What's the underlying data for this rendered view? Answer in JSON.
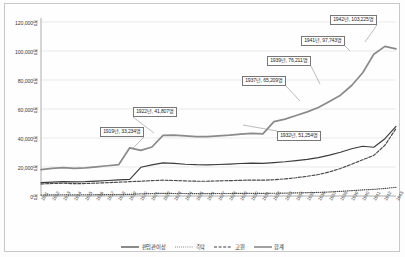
{
  "chart_data": {
    "type": "line",
    "title": "",
    "xlabel": "",
    "ylabel": "",
    "ylim": [
      0,
      120000
    ],
    "grid": true,
    "legend_position": "bottom",
    "y_ticks": [
      0,
      20000,
      40000,
      60000,
      80000,
      100000,
      120000
    ],
    "y_tick_labels": [
      "0명",
      "20,000명",
      "40,000명",
      "60,000명",
      "80,000명",
      "100,000명",
      "120,000명"
    ],
    "categories": [
      "1911",
      "1912",
      "1913",
      "1914",
      "1915",
      "1916",
      "1917",
      "1918",
      "1919",
      "1920",
      "1921",
      "1922",
      "1923",
      "1924",
      "1925",
      "1926",
      "1927",
      "1928",
      "1929",
      "1930",
      "1931",
      "1932",
      "1933",
      "1934",
      "1935",
      "1936",
      "1937",
      "1938",
      "1939",
      "1940",
      "1941",
      "1942",
      "1943"
    ],
    "series": [
      {
        "name": "판임관이상",
        "style": "solid-thin",
        "color": "#3c3c3c",
        "values": [
          9200,
          9600,
          9900,
          9700,
          9900,
          10300,
          10700,
          11100,
          11500,
          19800,
          21500,
          22800,
          22500,
          21900,
          21600,
          21500,
          21700,
          22000,
          22400,
          22700,
          22500,
          23000,
          23600,
          24400,
          25300,
          26500,
          28200,
          30200,
          32600,
          34300,
          33600,
          39500,
          48000
        ]
      },
      {
        "name": "촉탁",
        "style": "dotted",
        "color": "#4a4a4a",
        "values": [
          700,
          800,
          850,
          800,
          850,
          900,
          950,
          1000,
          1100,
          1500,
          1700,
          1800,
          1750,
          1700,
          1650,
          1650,
          1700,
          1750,
          1800,
          1850,
          1800,
          1900,
          2000,
          2150,
          2300,
          2500,
          2800,
          3200,
          3700,
          4200,
          4600,
          5200,
          6000
        ]
      },
      {
        "name": "고원",
        "style": "dashed",
        "color": "#4a4a4a",
        "values": [
          8300,
          8600,
          8800,
          8500,
          8600,
          8900,
          9200,
          9500,
          9900,
          10200,
          10600,
          10900,
          10700,
          10400,
          10200,
          10200,
          10400,
          10600,
          10800,
          11000,
          10900,
          11200,
          11800,
          12600,
          13600,
          14800,
          16600,
          19000,
          21900,
          25000,
          28000,
          35000,
          46500
        ]
      },
      {
        "name": "합계",
        "style": "solid-thick",
        "color": "#8a8a8a",
        "values": [
          18200,
          19000,
          19550,
          19000,
          19350,
          20100,
          20850,
          21600,
          33234,
          31500,
          33800,
          41807,
          42000,
          41500,
          41000,
          41000,
          41500,
          42000,
          42700,
          43200,
          42800,
          51254,
          53000,
          55500,
          58000,
          61000,
          65209,
          69500,
          76211,
          85000,
          97743,
          103225,
          101500
        ]
      }
    ],
    "annotations": [
      {
        "name": "annotation-1919",
        "label": "1919년, 33,234명",
        "year": "1919",
        "value": 33234,
        "box_left": 100,
        "box_top": 127,
        "anchor_x": 133,
        "anchor_y": 148
      },
      {
        "name": "annotation-1922",
        "label": "1922년, 41,807명",
        "year": "1922",
        "value": 41807,
        "box_left": 133,
        "box_top": 107,
        "anchor_x": 154,
        "anchor_y": 133
      },
      {
        "name": "annotation-1932",
        "label": "1932년, 51,254명",
        "year": "1932",
        "value": 51254,
        "box_left": 277,
        "box_top": 131,
        "anchor_x": 243,
        "anchor_y": 125
      },
      {
        "name": "annotation-1937",
        "label": "1937년, 65,209명",
        "year": "1937",
        "value": 65209,
        "box_left": 242,
        "box_top": 76,
        "anchor_x": 300,
        "anchor_y": 101
      },
      {
        "name": "annotation-1939",
        "label": "1939년, 76,211명",
        "year": "1939",
        "value": 76211,
        "box_left": 267,
        "box_top": 56,
        "anchor_x": 320,
        "anchor_y": 84
      },
      {
        "name": "annotation-1941",
        "label": "1941년, 97,743명",
        "year": "1941",
        "value": 97743,
        "box_left": 301,
        "box_top": 36,
        "anchor_x": 350,
        "anchor_y": 51
      },
      {
        "name": "annotation-1942",
        "label": "1942년, 103,225명",
        "year": "1942",
        "value": 103225,
        "box_left": 330,
        "box_top": 15,
        "anchor_x": 365,
        "anchor_y": 42
      }
    ]
  },
  "legend": {
    "items": [
      {
        "label": "판임관이상",
        "style": "solid-thin"
      },
      {
        "label": "촉탁",
        "style": "dotted"
      },
      {
        "label": "고원",
        "style": "dashed"
      },
      {
        "label": "합계",
        "style": "solid-thick"
      }
    ]
  }
}
